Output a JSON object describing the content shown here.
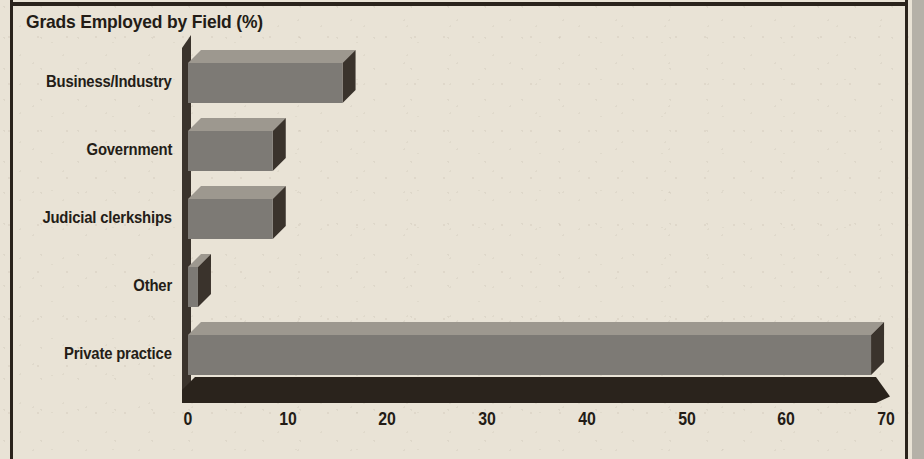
{
  "chart_data": {
    "type": "bar",
    "orientation": "horizontal",
    "title": "Grads Employed by Field (%)",
    "xlabel": "",
    "ylabel": "",
    "categories": [
      "Business/Industry",
      "Government",
      "Judicial clerkships",
      "Other",
      "Private practice"
    ],
    "values": [
      15.5,
      8.5,
      8.5,
      1,
      68.5
    ],
    "xticks": [
      "0",
      "10",
      "20",
      "30",
      "40",
      "50",
      "60",
      "70"
    ],
    "xtick_values": [
      0,
      10,
      20,
      30,
      40,
      50,
      60,
      70
    ],
    "xlim": [
      0,
      70
    ],
    "grid": false,
    "legend": null,
    "style": "3d-bars"
  },
  "colors": {
    "background": "#e9e3d6",
    "ink": "#2a231c",
    "bar_front": "#7d7a75",
    "bar_top": "#9d988f",
    "bar_side": "#3a332c",
    "axis": "#2a231c",
    "right_band": "#b5b1a8"
  }
}
